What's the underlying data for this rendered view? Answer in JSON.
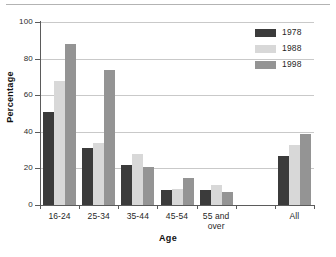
{
  "chart_data": {
    "type": "bar",
    "title": "",
    "xlabel": "Age",
    "ylabel": "Percentage",
    "ylim": [
      0,
      100
    ],
    "yticks": [
      0,
      20,
      40,
      60,
      80,
      100
    ],
    "ytick_labels": [
      "0",
      "20",
      "40",
      "60",
      "80",
      "100"
    ],
    "grid": true,
    "grid_axis": "y",
    "legend_position": "top-right",
    "categories": [
      "16-24",
      "25-34",
      "35-44",
      "45-54",
      "55 and over",
      "",
      "All"
    ],
    "category_lines": [
      [
        "16-24"
      ],
      [
        "25-34"
      ],
      [
        "35-44"
      ],
      [
        "45-54"
      ],
      [
        "55 and",
        "over"
      ],
      [
        ""
      ],
      [
        "All"
      ]
    ],
    "series": [
      {
        "name": "1978",
        "color": "#3b3b3b",
        "values": [
          51,
          31,
          22,
          8,
          8,
          null,
          27
        ]
      },
      {
        "name": "1988",
        "color": "#d8d8d8",
        "values": [
          68,
          34,
          28,
          8.5,
          11,
          null,
          33
        ]
      },
      {
        "name": "1998",
        "color": "#949494",
        "values": [
          88,
          74,
          21,
          15,
          7,
          null,
          39
        ]
      }
    ]
  },
  "legend": {
    "items": [
      {
        "label": "1978",
        "color": "#3b3b3b"
      },
      {
        "label": "1988",
        "color": "#d8d8d8"
      },
      {
        "label": "1998",
        "color": "#949494"
      }
    ]
  },
  "axes": {
    "x_title": "Age",
    "y_title": "Percentage"
  },
  "colors": {
    "series_1978": "#3b3b3b",
    "series_1988": "#d8d8d8",
    "series_1998": "#949494",
    "axis": "#5b5b5b",
    "grid": "#c9c9c9",
    "text": "#1f1f1f",
    "background": "#ffffff"
  }
}
